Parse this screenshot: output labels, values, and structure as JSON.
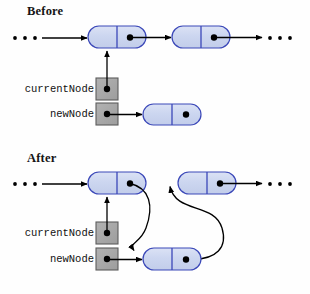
{
  "diagram": {
    "title_before": "Before",
    "title_after": "After",
    "labels": {
      "current_node": "currentNode",
      "new_node": "newNode"
    },
    "ellipsis_glyph": "•",
    "colors": {
      "node_fill": "#ccd6f0",
      "node_stroke": "#3b48b8",
      "node_highlight": "#b23cc8",
      "pointer_box_fill": "#a8a8a8",
      "pointer_box_stroke": "#555555",
      "dot": "#000000",
      "arrow": "#000000",
      "background": "#ffffff",
      "text": "#111111"
    },
    "before": {
      "title_pos": {
        "x": 27,
        "y": 4
      },
      "ellipsis_left": [
        {
          "x": 15,
          "y": 38
        },
        {
          "x": 25,
          "y": 38
        },
        {
          "x": 35,
          "y": 38
        }
      ],
      "ellipsis_right": [
        {
          "x": 270,
          "y": 38
        },
        {
          "x": 280,
          "y": 38
        },
        {
          "x": 290,
          "y": 38
        }
      ],
      "nodes": [
        {
          "name": "list-node-1",
          "x": 88,
          "y": 26,
          "w": 58,
          "h": 22,
          "highlighted": true,
          "dot": true
        },
        {
          "name": "list-node-2",
          "x": 172,
          "y": 26,
          "w": 58,
          "h": 22,
          "highlighted": false,
          "dot": true
        },
        {
          "name": "new-node",
          "x": 143,
          "y": 104,
          "w": 58,
          "h": 21,
          "highlighted": false,
          "dot": true
        }
      ],
      "pointer_boxes": [
        {
          "name": "current-node-box",
          "x": 96,
          "y": 78,
          "w": 22,
          "h": 22
        },
        {
          "name": "new-node-box",
          "x": 96,
          "y": 103,
          "w": 22,
          "h": 22
        }
      ],
      "label_positions": {
        "current_node": {
          "x": 22,
          "y": 83,
          "w": 72
        },
        "new_node": {
          "x": 22,
          "y": 108,
          "w": 72
        }
      }
    },
    "after": {
      "title_pos": {
        "x": 27,
        "y": 151
      },
      "ellipsis_left": [
        {
          "x": 15,
          "y": 184
        },
        {
          "x": 25,
          "y": 184
        },
        {
          "x": 35,
          "y": 184
        }
      ],
      "ellipsis_right": [
        {
          "x": 270,
          "y": 184
        },
        {
          "x": 280,
          "y": 184
        },
        {
          "x": 290,
          "y": 184
        }
      ],
      "nodes": [
        {
          "name": "list-node-1",
          "x": 88,
          "y": 172,
          "w": 58,
          "h": 22,
          "highlighted": false,
          "dot": true
        },
        {
          "name": "list-node-2",
          "x": 178,
          "y": 172,
          "w": 58,
          "h": 22,
          "highlighted": false,
          "dot": true
        },
        {
          "name": "new-node",
          "x": 143,
          "y": 248,
          "w": 58,
          "h": 22,
          "highlighted": false,
          "dot": true
        }
      ],
      "pointer_boxes": [
        {
          "name": "current-node-box",
          "x": 96,
          "y": 222,
          "w": 22,
          "h": 22
        },
        {
          "name": "new-node-box",
          "x": 96,
          "y": 248,
          "w": 22,
          "h": 22
        }
      ],
      "label_positions": {
        "current_node": {
          "x": 22,
          "y": 227,
          "w": 72
        },
        "new_node": {
          "x": 22,
          "y": 253,
          "w": 72
        }
      }
    }
  }
}
